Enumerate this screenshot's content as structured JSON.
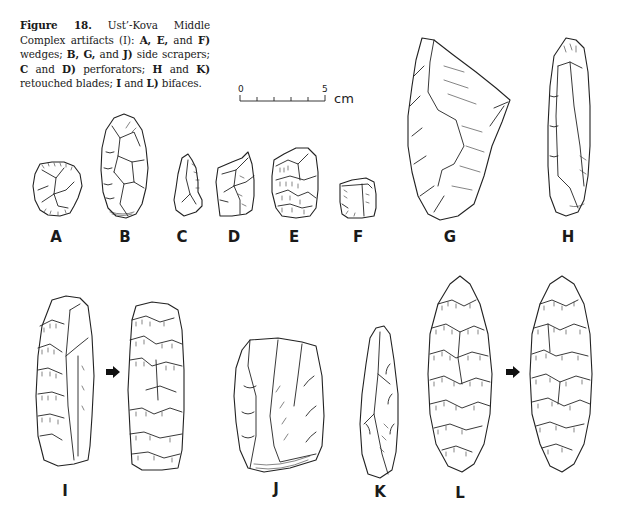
{
  "figure": {
    "number_label": "Figure 18.",
    "caption_parts": [
      {
        "text": "Figure 18.",
        "bold": true
      },
      {
        "text": " Ust’-Kova Middle Complex artifacts (I): ",
        "bold": false
      },
      {
        "text": "A, E,",
        "bold": true
      },
      {
        "text": " and ",
        "bold": false
      },
      {
        "text": "F)",
        "bold": true
      },
      {
        "text": " wedges; ",
        "bold": false
      },
      {
        "text": "B, G,",
        "bold": true
      },
      {
        "text": " and ",
        "bold": false
      },
      {
        "text": "J)",
        "bold": true
      },
      {
        "text": " side scrapers; ",
        "bold": false
      },
      {
        "text": "C",
        "bold": true
      },
      {
        "text": " and ",
        "bold": false
      },
      {
        "text": "D)",
        "bold": true
      },
      {
        "text": " perforators; ",
        "bold": false
      },
      {
        "text": "H",
        "bold": true
      },
      {
        "text": " and ",
        "bold": false
      },
      {
        "text": "K)",
        "bold": true
      },
      {
        "text": " retouched blades; ",
        "bold": false
      },
      {
        "text": "I",
        "bold": true
      },
      {
        "text": " and ",
        "bold": false
      },
      {
        "text": "L)",
        "bold": true
      },
      {
        "text": " bifaces.",
        "bold": false
      }
    ]
  },
  "scale_bar": {
    "start_label": "0",
    "end_label": "5",
    "unit": "cm",
    "divisions": 5
  },
  "artifacts": [
    {
      "id": "A",
      "label": "A",
      "category": "wedge"
    },
    {
      "id": "B",
      "label": "B",
      "category": "side scraper"
    },
    {
      "id": "C",
      "label": "C",
      "category": "perforator"
    },
    {
      "id": "D",
      "label": "D",
      "category": "perforator"
    },
    {
      "id": "E",
      "label": "E",
      "category": "wedge"
    },
    {
      "id": "F",
      "label": "F",
      "category": "wedge"
    },
    {
      "id": "G",
      "label": "G",
      "category": "side scraper"
    },
    {
      "id": "H",
      "label": "H",
      "category": "retouched blade"
    },
    {
      "id": "I",
      "label": "I",
      "category": "biface",
      "views": 2
    },
    {
      "id": "J",
      "label": "J",
      "category": "side scraper"
    },
    {
      "id": "K",
      "label": "K",
      "category": "retouched blade"
    },
    {
      "id": "L",
      "label": "L",
      "category": "biface",
      "views": 2
    }
  ],
  "icons": {
    "flip_arrow": "rotation-arrow-icon"
  }
}
